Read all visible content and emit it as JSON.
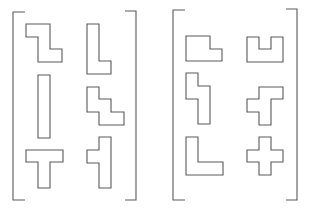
{
  "diagram": {
    "type": "shape-matrix",
    "stroke_color": "#5a5a5a",
    "background": "#ffffff",
    "panels": [
      {
        "name": "left-panel",
        "brackets": {
          "left": "M25,12 L13,12 L13,200 L25,200",
          "right": "M125,11 L136,11 L136,200 L125,200"
        },
        "shapes": [
          {
            "name": "z-shape",
            "points": "26,24 50,24 50,49 62,49 62,62 38,62 38,37 26,37"
          },
          {
            "name": "l-shape-tall",
            "points": "87,24 99,24 99,61 111,61 111,74 87,74"
          },
          {
            "name": "i-bar",
            "points": "38,75 50,75 50,138 38,138"
          },
          {
            "name": "stair-shape",
            "points": "87,87 99,87 99,99 111,99 111,112 124,112 124,125 99,125 99,112 87,112"
          },
          {
            "name": "t-shape",
            "points": "26,150 63,150 63,162 50,162 50,188 38,188 38,162 26,162"
          },
          {
            "name": "left-t-shape",
            "points": "99,137 111,137 111,188 99,188 99,163 87,163 87,150 99,150"
          }
        ]
      },
      {
        "name": "right-panel",
        "brackets": {
          "left": "M185,10 L173,10 L173,200 L185,200",
          "right": "M286,9 L297,9 L297,200 L286,200"
        },
        "shapes": [
          {
            "name": "p-shape",
            "points": "186,36 210,36 210,49 222,49 222,61 186,61"
          },
          {
            "name": "u-shape",
            "points": "247,37 259,37 259,49 271,49 271,37 283,37 283,62 247,62"
          },
          {
            "name": "s-vertical-shape",
            "points": "186,73 198,73 198,86 210,86 210,124 198,124 198,99 186,99"
          },
          {
            "name": "f-shape",
            "points": "259,87 283,87 283,99 271,99 271,125 259,125 259,112 247,112 247,99 259,99"
          },
          {
            "name": "l-shape",
            "points": "186,137 198,137 198,162 223,162 223,175 186,175"
          },
          {
            "name": "plus-shape",
            "points": "259,137 271,137 271,150 283,150 283,162 271,162 271,175 259,175 259,162 247,162 247,150 259,150"
          }
        ]
      }
    ]
  }
}
